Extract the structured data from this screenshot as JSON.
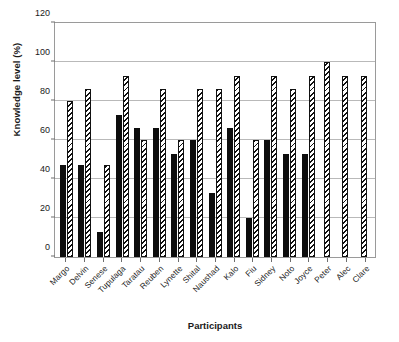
{
  "chart_data": {
    "type": "bar",
    "title": "",
    "xlabel": "Participants",
    "ylabel": "Knowledge level (%)",
    "ylim": [
      0,
      120
    ],
    "yticks": [
      0,
      20,
      40,
      60,
      80,
      100,
      120
    ],
    "grid": true,
    "legend": "none",
    "categories": [
      "Margo",
      "Delvin",
      "Senese",
      "Tupulaga",
      "Taratau",
      "Reuben",
      "Lynette",
      "Shital",
      "Naushad",
      "Kalo",
      "Fiu",
      "Sidney",
      "Noto",
      "Joyce",
      "Peter",
      "Alec",
      "Clare"
    ],
    "series": [
      {
        "name": "solid-black",
        "style": "solid",
        "values": [
          47,
          47,
          13,
          73,
          66,
          66,
          53,
          60,
          33,
          66,
          20,
          60,
          53,
          53,
          0,
          0,
          0
        ]
      },
      {
        "name": "diagonal-hatched",
        "style": "hatched",
        "values": [
          80,
          86,
          47,
          93,
          60,
          86,
          60,
          86,
          86,
          93,
          60,
          93,
          86,
          93,
          100,
          93,
          93
        ]
      }
    ]
  }
}
